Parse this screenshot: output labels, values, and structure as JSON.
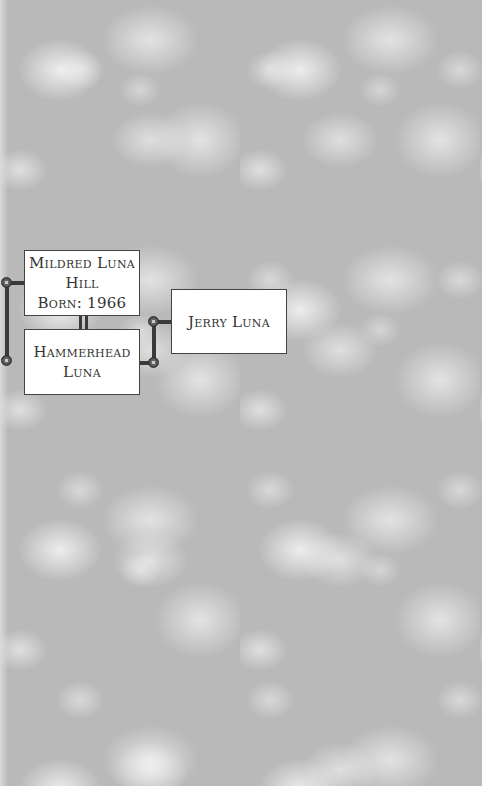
{
  "family_tree": {
    "people": [
      {
        "id": "mildred",
        "name_line1": "Mildred Luna",
        "name_line2": "Hill",
        "born_line": "Born: 1966"
      },
      {
        "id": "hammerhead",
        "name_line1": "Hammerhead",
        "name_line2": "Luna"
      },
      {
        "id": "jerry",
        "name_line1": "Jerry Luna"
      }
    ],
    "relationships": [
      {
        "type": "couple",
        "members": [
          "mildred",
          "hammerhead"
        ]
      },
      {
        "type": "parent-child",
        "parent": "hammerhead",
        "child": "jerry"
      }
    ]
  },
  "colors": {
    "background": "#b9b9b9",
    "lace": "#ffffff",
    "box_fill": "#ffffff",
    "box_border": "#444444",
    "connector": "#3a3a3a",
    "text": "#333333"
  }
}
